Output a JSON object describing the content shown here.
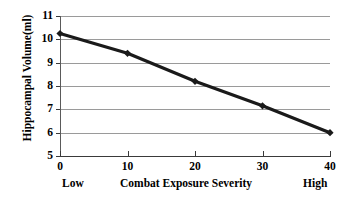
{
  "chart_data": {
    "type": "line",
    "title": "",
    "xlabel": "Combat Exposure Severity",
    "ylabel": "Hippocampal Volume(ml)",
    "x": [
      0,
      10,
      20,
      30,
      40
    ],
    "values": [
      10.25,
      9.4,
      8.2,
      7.15,
      6.0
    ],
    "series": [
      {
        "name": "Hippocampal Volume",
        "values": [
          10.25,
          9.4,
          8.2,
          7.15,
          6.0
        ],
        "color": "#1a1a1a",
        "marker": "diamond"
      }
    ],
    "xlim": [
      0,
      40
    ],
    "ylim": [
      5,
      11
    ],
    "x_ticks": [
      "0",
      "10",
      "20",
      "30",
      "40"
    ],
    "y_ticks": [
      "11",
      "10",
      "9",
      "8",
      "7",
      "6",
      "5"
    ],
    "grid": true,
    "grid_axis": "y",
    "grid_color": "#9a9a9a",
    "legend": "none",
    "annotations": {
      "x_low_label": "Low",
      "x_high_label": "High"
    }
  },
  "axes": {
    "y_title": "Hippocampal Volume(ml)",
    "x_title": "Combat Exposure Severity",
    "x_low": "Low",
    "x_high": "High"
  }
}
